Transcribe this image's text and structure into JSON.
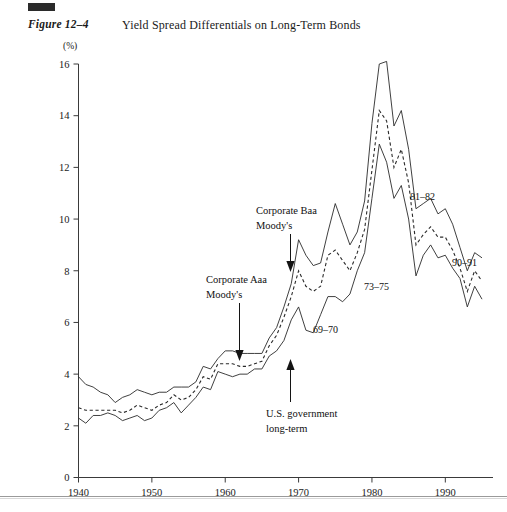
{
  "figure": {
    "marker": "black-square-marker",
    "label": "Figure 12–4",
    "title": "Yield Spread Differentials on Long-Term Bonds"
  },
  "chart_data": {
    "type": "line",
    "title": "Yield Spread Differentials on Long-Term Bonds",
    "xlabel": "",
    "ylabel": "(%)",
    "yunit": "(%)",
    "xlim": [
      1940,
      1995
    ],
    "ylim": [
      0,
      16
    ],
    "yticks": [
      0,
      2,
      4,
      6,
      8,
      10,
      12,
      14,
      16
    ],
    "xticks": [
      1940,
      1950,
      1960,
      1970,
      1980,
      1990
    ],
    "xticklabels": [
      "1940",
      "1950",
      "1960",
      "1970",
      "1980",
      "1990"
    ],
    "yticklabels": [
      "0",
      "2",
      "4",
      "6",
      "8",
      "10",
      "12",
      "14",
      "16"
    ],
    "grid": false,
    "legend": "inline-annotations",
    "x": [
      1940,
      1941,
      1942,
      1943,
      1944,
      1945,
      1946,
      1947,
      1948,
      1949,
      1950,
      1951,
      1952,
      1953,
      1954,
      1955,
      1956,
      1957,
      1958,
      1959,
      1960,
      1961,
      1962,
      1963,
      1964,
      1965,
      1966,
      1967,
      1968,
      1969,
      1970,
      1971,
      1972,
      1973,
      1974,
      1975,
      1976,
      1977,
      1978,
      1979,
      1980,
      1981,
      1982,
      1983,
      1984,
      1985,
      1986,
      1987,
      1988,
      1989,
      1990,
      1991,
      1992,
      1993,
      1994,
      1995
    ],
    "series": [
      {
        "name": "Corporate Baa Moody's",
        "style": "solid",
        "values": [
          3.9,
          3.6,
          3.5,
          3.3,
          3.2,
          2.9,
          3.1,
          3.2,
          3.4,
          3.3,
          3.2,
          3.3,
          3.3,
          3.5,
          3.5,
          3.5,
          3.7,
          4.3,
          4.2,
          4.6,
          4.9,
          4.9,
          4.8,
          4.8,
          4.8,
          4.8,
          5.4,
          5.8,
          6.6,
          7.5,
          9.2,
          8.6,
          8.2,
          8.3,
          9.5,
          10.6,
          9.8,
          9.0,
          9.5,
          10.7,
          13.7,
          16.0,
          16.1,
          13.6,
          14.2,
          12.7,
          10.4,
          10.6,
          10.8,
          10.2,
          10.4,
          9.8,
          8.9,
          8.0,
          8.7,
          8.5
        ]
      },
      {
        "name": "Corporate Aaa Moody's",
        "style": "dashed",
        "values": [
          2.7,
          2.6,
          2.6,
          2.6,
          2.6,
          2.6,
          2.5,
          2.6,
          2.8,
          2.7,
          2.6,
          2.8,
          2.9,
          3.2,
          3.0,
          3.1,
          3.4,
          3.9,
          3.8,
          4.4,
          4.4,
          4.4,
          4.3,
          4.3,
          4.4,
          4.5,
          5.1,
          5.5,
          6.2,
          7.0,
          8.0,
          7.4,
          7.2,
          7.4,
          8.6,
          8.8,
          8.4,
          8.0,
          8.7,
          9.6,
          11.9,
          14.2,
          13.8,
          12.0,
          12.7,
          11.4,
          9.0,
          9.4,
          9.7,
          9.3,
          9.3,
          8.8,
          8.1,
          7.2,
          8.0,
          7.6
        ]
      },
      {
        "name": "U.S. government long-term",
        "style": "solid",
        "values": [
          2.3,
          2.1,
          2.4,
          2.4,
          2.5,
          2.4,
          2.2,
          2.3,
          2.4,
          2.2,
          2.3,
          2.6,
          2.7,
          2.9,
          2.5,
          2.8,
          3.1,
          3.5,
          3.4,
          4.1,
          4.0,
          3.9,
          4.0,
          4.0,
          4.2,
          4.2,
          4.7,
          4.9,
          5.3,
          6.1,
          6.6,
          5.7,
          5.6,
          6.3,
          7.0,
          7.0,
          6.8,
          7.1,
          8.0,
          8.7,
          10.8,
          12.9,
          12.2,
          10.8,
          11.3,
          10.0,
          7.8,
          8.6,
          9.0,
          8.5,
          8.6,
          8.1,
          7.7,
          6.6,
          7.4,
          6.9
        ]
      }
    ],
    "annotations": [
      {
        "name": "annotation-corporate-baa",
        "text": "Corporate Baa",
        "text2": "Moody's",
        "target_year": 1970,
        "target_value": 7.0,
        "leader": "arrow-down"
      },
      {
        "name": "annotation-corporate-aaa",
        "text": "Corporate Aaa",
        "text2": "Moody's",
        "target_year": 1963,
        "target_value": 4.4,
        "leader": "arrow-down"
      },
      {
        "name": "annotation-us-government",
        "text": "U.S. government",
        "text2": "long-term",
        "target_year": 1970,
        "target_value": 5.4,
        "leader": "arrow-up"
      },
      {
        "name": "annotation-era-69-70",
        "text": "69–70"
      },
      {
        "name": "annotation-era-73-75",
        "text": "73–75"
      },
      {
        "name": "annotation-era-81-82",
        "text": "81–82"
      },
      {
        "name": "annotation-era-90-91",
        "text": "90–91"
      }
    ]
  }
}
